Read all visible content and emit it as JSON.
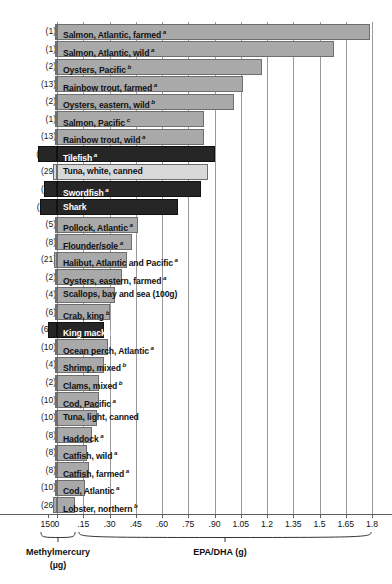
{
  "chart_data": {
    "type": "bar",
    "orientation": "horizontal",
    "title": "",
    "xlabel": "EPA/DHA (g)",
    "xlabel_secondary": "Methylmercury (µg)",
    "ylabel": "",
    "grid": true,
    "legend": "none",
    "axis_epa": {
      "label": "EPA/DHA (g)",
      "ticks": [
        0,
        0.15,
        0.3,
        0.45,
        0.6,
        0.75,
        0.9,
        1.05,
        1.2,
        1.35,
        1.5,
        1.65,
        1.8
      ],
      "tick_labels": [
        "0",
        ".15",
        ".30",
        ".45",
        ".60",
        ".75",
        ".90",
        "1.05",
        "1.2",
        "1.35",
        "1.5",
        "1.65",
        "1.8"
      ],
      "xlim": [
        0,
        1.8
      ]
    },
    "axis_mercury": {
      "label": "Methylmercury",
      "units": "(µg)",
      "ticks": [
        150,
        0
      ],
      "tick_labels": [
        "150",
        "0"
      ],
      "xlim": [
        150,
        0
      ]
    },
    "series_names": [
      "EPA/DHA (g)",
      "Methylmercury (µg)"
    ],
    "categories": [
      "Salmon, Atlantic, farmed",
      "Salmon, Atlantic, wild",
      "Oysters, Pacific",
      "Rainbow trout, farmed",
      "Oysters, eastern, wild",
      "Salmon, Pacific",
      "Rainbow trout, wild",
      "Tilefish",
      "Tuna, white, canned",
      "Swordfish",
      "Shark",
      "Pollock, Atlantic",
      "Flounder/sole",
      "Halibut, Atlantic and Pacific",
      "Oysters, eastern, farmed",
      "Scallops, bay and sea (100g)",
      "Crab, king",
      "King mackerel",
      "Ocean perch, Atlantic",
      "Shrimp, mixed",
      "Clams, mixed",
      "Cod, Pacific",
      "Tuna, light, canned",
      "Haddock",
      "Catfish, wild",
      "Catfish, farmed",
      "Cod, Atlantic",
      "Lobster, northern"
    ],
    "epa_dha_g": [
      1.79,
      1.58,
      1.17,
      1.06,
      1.01,
      0.84,
      0.84,
      0.9,
      0.86,
      0.82,
      0.69,
      0.46,
      0.43,
      0.4,
      0.37,
      0.33,
      0.3,
      0.27,
      0.29,
      0.27,
      0.24,
      0.24,
      0.23,
      0.2,
      0.17,
      0.18,
      0.16,
      0.1
    ],
    "methylmercury_ug": [
      1,
      1,
      2,
      13,
      2,
      1,
      13,
      122,
      29,
      81,
      112,
      5,
      8,
      21,
      2,
      4,
      6,
      61,
      10,
      4,
      2,
      10,
      10,
      8,
      8,
      8,
      10,
      26
    ],
    "footnotes": [
      "a",
      "a",
      "b",
      "a",
      "b",
      "c",
      "a",
      "a",
      "",
      "a",
      "",
      "a",
      "a",
      "a",
      "a",
      "",
      "b",
      "a",
      "a",
      "b",
      "b",
      "a",
      "",
      "a",
      "a",
      "a",
      "a",
      "b"
    ],
    "styles": [
      "light",
      "light",
      "light",
      "light",
      "light",
      "light",
      "light",
      "dark",
      "pale",
      "dark",
      "dark",
      "light",
      "light",
      "light",
      "light",
      "light",
      "light",
      "dark",
      "light",
      "light",
      "light",
      "light",
      "light",
      "light",
      "light",
      "light",
      "light",
      "light"
    ],
    "colors": {
      "light_bar": "#a9a9a9",
      "dark_bar": "#262626",
      "pale_bar": "#d8d8d8",
      "bar_border": "#6e6e6e",
      "gridline": "#9a9a9a",
      "axis": "#5f5f5f",
      "text": "#111111",
      "dark_bar_text": "#ffffff"
    }
  },
  "rows": [
    {
      "paren": "(1)",
      "label": "Salmon, Atlantic, farmed",
      "sup": "a"
    },
    {
      "paren": "(1)",
      "label": "Salmon, Atlantic, wild",
      "sup": "a"
    },
    {
      "paren": "(2)",
      "label": "Oysters, Pacific",
      "sup": "b"
    },
    {
      "paren": "(13)",
      "label": "Rainbow trout, farmed",
      "sup": "a"
    },
    {
      "paren": "(2)",
      "label": "Oysters, eastern, wild",
      "sup": "b"
    },
    {
      "paren": "(1)",
      "label": "Salmon, Pacific",
      "sup": "c"
    },
    {
      "paren": "(13)",
      "label": "Rainbow trout, wild",
      "sup": "a"
    },
    {
      "paren": "(122)",
      "label": "Tilefish",
      "sup": "a"
    },
    {
      "paren": "(29)",
      "label": "Tuna, white, canned",
      "sup": ""
    },
    {
      "paren": "(81)",
      "label": "Swordfish",
      "sup": "a"
    },
    {
      "paren": "(112)",
      "label": "Shark",
      "sup": ""
    },
    {
      "paren": "(5)",
      "label": "Pollock, Atlantic",
      "sup": "a"
    },
    {
      "paren": "(8)",
      "label": "Flounder/sole",
      "sup": "a"
    },
    {
      "paren": "(21)",
      "label": "Halibut, Atlantic and Pacific",
      "sup": "a"
    },
    {
      "paren": "(2)",
      "label": "Oysters, eastern, farmed",
      "sup": "a"
    },
    {
      "paren": "(4)",
      "label": "Scallops, bay and sea (100g)",
      "sup": ""
    },
    {
      "paren": "(6)",
      "label": "Crab, king",
      "sup": "b"
    },
    {
      "paren": "(61)",
      "label": "King mackerel",
      "sup": "a"
    },
    {
      "paren": "(10)",
      "label": "Ocean perch, Atlantic",
      "sup": "a"
    },
    {
      "paren": "(4)",
      "label": "Shrimp, mixed",
      "sup": "b"
    },
    {
      "paren": "(2)",
      "label": "Clams, mixed",
      "sup": "b"
    },
    {
      "paren": "(10)",
      "label": "Cod, Pacific",
      "sup": "a"
    },
    {
      "paren": "(10)",
      "label": "Tuna, light, canned",
      "sup": ""
    },
    {
      "paren": "(8)",
      "label": "Haddock",
      "sup": "a"
    },
    {
      "paren": "(8)",
      "label": "Catfish, wild",
      "sup": "a"
    },
    {
      "paren": "(8)",
      "label": "Catfish, farmed",
      "sup": "a"
    },
    {
      "paren": "(10)",
      "label": "Cod, Atlantic",
      "sup": "a"
    },
    {
      "paren": "(26)",
      "label": "Lobster, northern",
      "sup": "b"
    }
  ],
  "axis": {
    "mercury_caption_line1": "Methylmercury",
    "mercury_caption_line2": "(µg)",
    "epa_caption": "EPA/DHA (g)"
  }
}
